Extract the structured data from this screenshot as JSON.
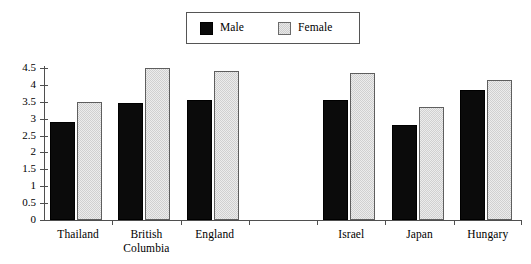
{
  "legend": {
    "entries": [
      {
        "label": "Male",
        "swatch": "black-square-swatch",
        "color": "#0b0b0b"
      },
      {
        "label": "Female",
        "swatch": "light-gray-square-swatch",
        "color": "#dedede"
      }
    ]
  },
  "axis": {
    "y_ticks": [
      "0",
      "0.5",
      "1",
      "1.5",
      "2",
      "2.5",
      "3",
      "3.5",
      "4",
      "4.5"
    ]
  },
  "chart_data": {
    "type": "bar",
    "title": "",
    "subtitle": "",
    "xlabel": "",
    "ylabel": "",
    "ylim": [
      0,
      4.5
    ],
    "ytick_step": 0.5,
    "grid": false,
    "legend_position": "top-center",
    "categories": [
      "Thailand",
      "British\nColumbia",
      "England",
      "",
      "Israel",
      "Japan",
      "Hungary"
    ],
    "series": [
      {
        "name": "Male",
        "color": "#0b0b0b",
        "values": [
          2.9,
          3.45,
          3.55,
          null,
          3.55,
          2.8,
          3.85
        ]
      },
      {
        "name": "Female",
        "color": "#dedede",
        "values": [
          3.5,
          4.5,
          4.4,
          null,
          4.35,
          3.35,
          4.15
        ]
      }
    ]
  }
}
